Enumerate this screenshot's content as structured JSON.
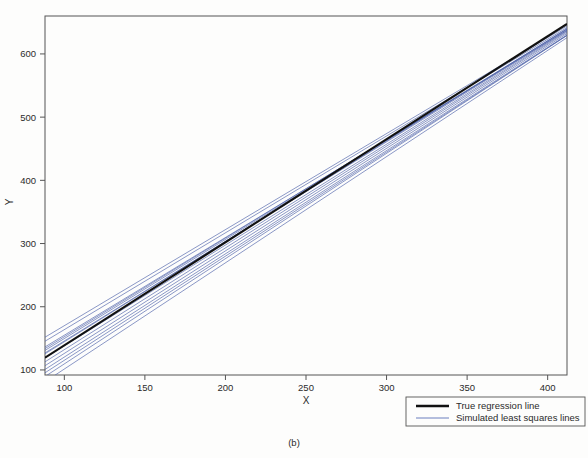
{
  "figure": {
    "caption": "(b)",
    "background_color": "#fdfdfc"
  },
  "chart_data": {
    "type": "line",
    "title": "",
    "subtitle": "",
    "xlabel": "X",
    "ylabel": "Y",
    "xlim": [
      88,
      412
    ],
    "ylim": [
      92,
      660
    ],
    "xticks": [
      100,
      150,
      200,
      250,
      300,
      350,
      400
    ],
    "xticklabels": [
      "100",
      "150",
      "200",
      "250",
      "300",
      "350",
      "400"
    ],
    "yticks": [
      100,
      200,
      300,
      400,
      500,
      600
    ],
    "yticklabels": [
      "100",
      "200",
      "300",
      "400",
      "500",
      "600"
    ],
    "grid": false,
    "legend_position": "outside-bottom-right",
    "colors": {
      "true_line": "#111111",
      "simulated_lines": "#4a5fa8",
      "frame": "#555555",
      "text": "#2b2b2b"
    },
    "series": [
      {
        "name": "True regression line",
        "type": "line",
        "color": "#111111",
        "linewidth": 2.2,
        "slope": 1.63,
        "intercept": -24.0,
        "x": [
          88,
          412
        ],
        "values": [
          119.4,
          647.6
        ]
      },
      {
        "name": "Simulated least squares lines",
        "type": "line-bundle",
        "color": "#4a5fa8",
        "linewidth": 0.7,
        "count": 14,
        "pivot": {
          "x": 248,
          "y": 380
        },
        "lines": [
          {
            "slope": 1.575,
            "intercept": -11.6,
            "x": [
              88,
              412
            ],
            "values": [
              127.0,
              637.3
            ]
          },
          {
            "slope": 1.596,
            "intercept": -21.6,
            "x": [
              88,
              412
            ],
            "values": [
              118.9,
              635.9
            ]
          },
          {
            "slope": 1.546,
            "intercept": 0.4,
            "x": [
              88,
              412
            ],
            "values": [
              136.4,
              637.3
            ]
          },
          {
            "slope": 1.622,
            "intercept": -36.0,
            "x": [
              88,
              412
            ],
            "values": [
              106.7,
              632.3
            ]
          },
          {
            "slope": 1.56,
            "intercept": -3.5,
            "x": [
              88,
              412
            ],
            "values": [
              133.8,
              639.4
            ]
          },
          {
            "slope": 1.648,
            "intercept": -49.5,
            "x": [
              88,
              412
            ],
            "values": [
              95.5,
              629.3
            ]
          },
          {
            "slope": 1.532,
            "intercept": 10.6,
            "x": [
              88,
              412
            ],
            "values": [
              145.4,
              641.7
            ]
          },
          {
            "slope": 1.666,
            "intercept": -57.0,
            "x": [
              88,
              412
            ],
            "values": [
              89.6,
              629.2
            ]
          },
          {
            "slope": 1.588,
            "intercept": -14.2,
            "x": [
              88,
              412
            ],
            "values": [
              125.5,
              640.0
            ]
          },
          {
            "slope": 1.61,
            "intercept": -28.9,
            "x": [
              88,
              412
            ],
            "values": [
              112.8,
              634.4
            ]
          },
          {
            "slope": 1.568,
            "intercept": -7.0,
            "x": [
              88,
              412
            ],
            "values": [
              130.9,
              638.9
            ]
          },
          {
            "slope": 1.634,
            "intercept": -43.0,
            "x": [
              88,
              412
            ],
            "values": [
              100.8,
              630.0
            ]
          },
          {
            "slope": 1.52,
            "intercept": 18.0,
            "x": [
              88,
              412
            ],
            "values": [
              151.8,
              644.2
            ]
          },
          {
            "slope": 1.68,
            "intercept": -66.5,
            "x": [
              88,
              412
            ],
            "values": [
              81.3,
              625.7
            ]
          }
        ]
      }
    ]
  },
  "legend": {
    "entries": [
      {
        "label": "True regression line",
        "color": "#111111",
        "linewidth": 2.4
      },
      {
        "label": "Simulated least squares lines",
        "color": "#5a70b8",
        "linewidth": 0.8
      }
    ]
  }
}
